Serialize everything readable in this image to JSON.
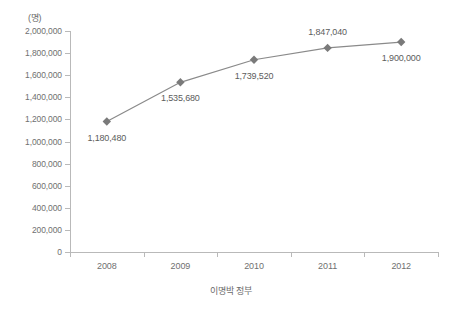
{
  "chart_data": {
    "type": "line",
    "title": "",
    "subtitle": "",
    "unit_label": "(명)",
    "xlabel": "이명박 정부",
    "ylabel": "",
    "categories": [
      "2008",
      "2009",
      "2010",
      "2011",
      "2012"
    ],
    "values": [
      1180480,
      1535680,
      1739520,
      1847040,
      1900000
    ],
    "point_labels": [
      "1,180,480",
      "1,535,680",
      "1,739,520",
      "1,847,040",
      "1,900,000"
    ],
    "point_label_positions": [
      "below",
      "below",
      "below",
      "above",
      "below"
    ],
    "ylim": [
      0,
      2000000
    ],
    "ytick_values": [
      2000000,
      1800000,
      1600000,
      1400000,
      1200000,
      1000000,
      800000,
      600000,
      400000,
      200000,
      0
    ],
    "ytick_labels": [
      "2,000,000",
      "1,800,000",
      "1,600,000",
      "1,400,000",
      "1,200,000",
      "1,000,000",
      "800,000",
      "600,000",
      "400,000",
      "200,000",
      "0"
    ],
    "grid": false,
    "legend": "none",
    "series": [
      {
        "name": "이명박 정부",
        "values": [
          1180480,
          1535680,
          1739520,
          1847040,
          1900000
        ],
        "line_color": "#8a8a8a",
        "marker_color": "#7a7a7a",
        "marker_shape": "diamond"
      }
    ],
    "colors": {
      "line": "#8a8a8a",
      "marker": "#7a7a7a",
      "axis": "#b9b9b9",
      "tick_text": "#707070",
      "label_text": "#5c5c5c",
      "background": "#ffffff"
    }
  }
}
